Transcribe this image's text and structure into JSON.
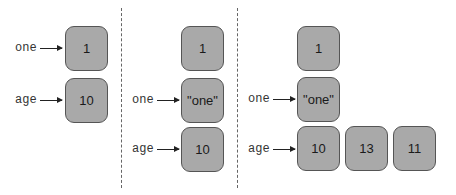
{
  "panels": [
    {
      "boxes": [
        {
          "value": "1"
        },
        {
          "value": "10"
        }
      ],
      "labels": [
        {
          "name": "one",
          "points_to": "1"
        },
        {
          "name": "age",
          "points_to": "10"
        }
      ]
    },
    {
      "boxes": [
        {
          "value": "1"
        },
        {
          "value": "\"one\""
        },
        {
          "value": "10"
        }
      ],
      "labels": [
        {
          "name": "one",
          "points_to": "\"one\""
        },
        {
          "name": "age",
          "points_to": "10"
        }
      ]
    },
    {
      "boxes": [
        {
          "value": "1"
        },
        {
          "value": "\"one\""
        },
        {
          "value": "10"
        },
        {
          "value": "13"
        },
        {
          "value": "11"
        }
      ],
      "labels": [
        {
          "name": "one",
          "points_to": "\"one\""
        },
        {
          "name": "age",
          "points_to": "10"
        }
      ]
    }
  ],
  "colors": {
    "box_fill": "#a9a9a9",
    "box_border": "#555555",
    "divider": "#666666"
  }
}
